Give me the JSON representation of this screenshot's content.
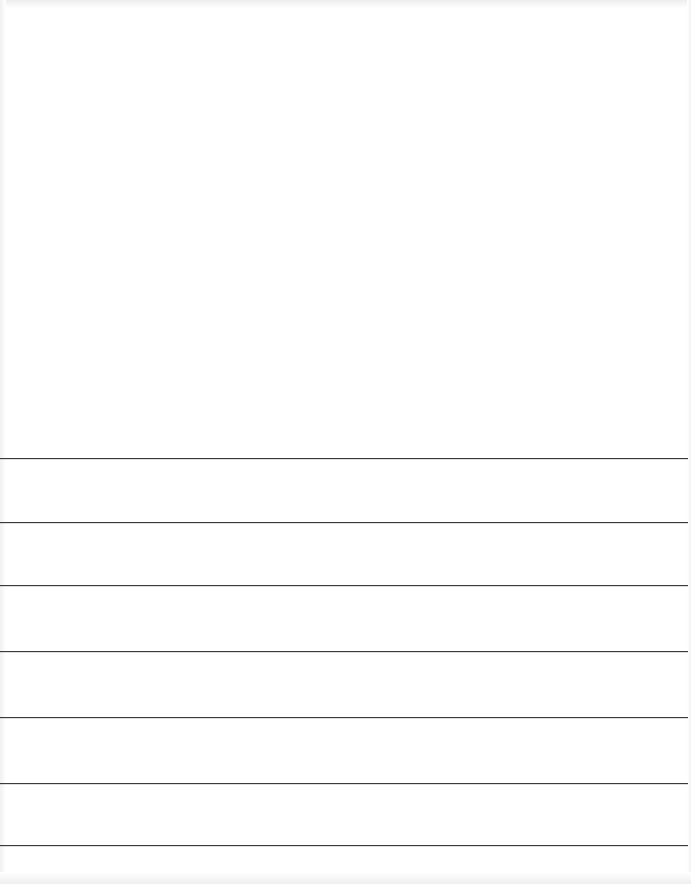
{
  "document": {
    "type": "lined-sheet",
    "text": "",
    "rule_color": "#3a3a3a",
    "background": "#ffffff",
    "rules": [
      {
        "y": 458
      },
      {
        "y": 522
      },
      {
        "y": 585
      },
      {
        "y": 651
      },
      {
        "y": 717
      },
      {
        "y": 783
      },
      {
        "y": 845
      }
    ]
  }
}
